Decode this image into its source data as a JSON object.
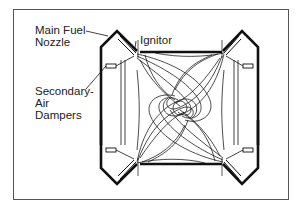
{
  "diagram": {
    "type": "tangential-fired furnace cross-section (corner burners)",
    "labels": {
      "main_fuel_nozzle_line1": "Main Fuel",
      "main_fuel_nozzle_line2": "Nozzle",
      "ignitor": "Ignitor",
      "secondary_air_line1": "Secondary-",
      "secondary_air_line2": "Air",
      "secondary_air_line3": "Dampers"
    },
    "components": [
      "main-fuel-nozzle",
      "ignitor",
      "secondary-air-damper",
      "furnace-box",
      "swirl-flow-lines"
    ],
    "colors": {
      "stroke": "#111111",
      "background": "#ffffff",
      "frame": "#555555"
    }
  }
}
